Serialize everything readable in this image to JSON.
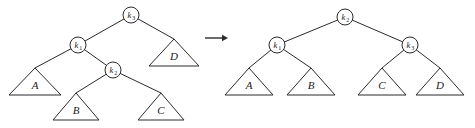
{
  "figure": {
    "caption": "",
    "transformation": "single-rotation-tree-restructure",
    "arrow": {
      "name": "transform-arrow",
      "glyph": "→",
      "direction": "right",
      "x1": 205,
      "y1": 38,
      "x2": 228,
      "y2": 38
    },
    "colors": {
      "stroke": "#2b2b2b",
      "fill": "#ffffff",
      "text": "#1a1a1a",
      "background": "#ffffff"
    }
  },
  "left_tree": {
    "name": "before-tree",
    "nodes": [
      {
        "id": "L-k3",
        "base": "k",
        "sub": "3",
        "label": "k3",
        "cx": 131,
        "cy": 15,
        "r": 8
      },
      {
        "id": "L-k1",
        "base": "k",
        "sub": "1",
        "label": "k1",
        "cx": 78,
        "cy": 45,
        "r": 8
      },
      {
        "id": "L-k2",
        "base": "k",
        "sub": "2",
        "label": "k2",
        "cx": 113,
        "cy": 70,
        "r": 8
      }
    ],
    "subtrees": [
      {
        "id": "L-A",
        "label": "A",
        "apex_x": 35,
        "apex_y": 68,
        "half_w": 26,
        "base_y": 95
      },
      {
        "id": "L-B",
        "label": "B",
        "apex_x": 76,
        "apex_y": 93,
        "half_w": 23,
        "base_y": 120
      },
      {
        "id": "L-C",
        "label": "C",
        "apex_x": 161,
        "apex_y": 93,
        "half_w": 23,
        "base_y": 120
      },
      {
        "id": "L-D",
        "label": "D",
        "apex_x": 174,
        "apex_y": 39,
        "half_w": 25,
        "base_y": 66
      }
    ],
    "edges": [
      {
        "from": "L-k3",
        "to": "L-k1"
      },
      {
        "from": "L-k3",
        "to": "L-D"
      },
      {
        "from": "L-k1",
        "to": "L-A"
      },
      {
        "from": "L-k1",
        "to": "L-k2"
      },
      {
        "from": "L-k2",
        "to": "L-B"
      },
      {
        "from": "L-k2",
        "to": "L-C"
      }
    ]
  },
  "right_tree": {
    "name": "after-tree",
    "nodes": [
      {
        "id": "R-k2",
        "base": "k",
        "sub": "2",
        "label": "k2",
        "cx": 345,
        "cy": 17,
        "r": 8
      },
      {
        "id": "R-k1",
        "base": "k",
        "sub": "1",
        "label": "k1",
        "cx": 277,
        "cy": 45,
        "r": 8
      },
      {
        "id": "R-k3",
        "base": "k",
        "sub": "3",
        "label": "k3",
        "cx": 410,
        "cy": 45,
        "r": 8
      }
    ],
    "subtrees": [
      {
        "id": "R-A",
        "label": "A",
        "apex_x": 249,
        "apex_y": 68,
        "half_w": 24,
        "base_y": 95
      },
      {
        "id": "R-B",
        "label": "B",
        "apex_x": 311,
        "apex_y": 68,
        "half_w": 24,
        "base_y": 95
      },
      {
        "id": "R-C",
        "label": "C",
        "apex_x": 382,
        "apex_y": 68,
        "half_w": 24,
        "base_y": 95
      },
      {
        "id": "R-D",
        "label": "D",
        "apex_x": 440,
        "apex_y": 68,
        "half_w": 24,
        "base_y": 95
      }
    ],
    "edges": [
      {
        "from": "R-k2",
        "to": "R-k1"
      },
      {
        "from": "R-k2",
        "to": "R-k3"
      },
      {
        "from": "R-k1",
        "to": "R-A"
      },
      {
        "from": "R-k1",
        "to": "R-B"
      },
      {
        "from": "R-k3",
        "to": "R-C"
      },
      {
        "from": "R-k3",
        "to": "R-D"
      }
    ]
  }
}
